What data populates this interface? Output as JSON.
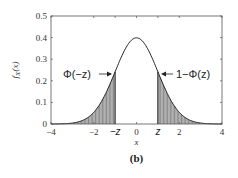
{
  "chart_data": {
    "type": "area",
    "title": "",
    "caption": "(b)",
    "xlabel": "x",
    "ylabel": "f_X(x)",
    "xlim": [
      -4,
      4
    ],
    "ylim": [
      0,
      0.5
    ],
    "xticks": [
      "-4",
      "-2",
      "-z",
      "0",
      "z",
      "2",
      "4"
    ],
    "xtick_values": [
      -4,
      -2,
      -1,
      0,
      1,
      2,
      4
    ],
    "yticks": [
      "0",
      "0.1",
      "0.2",
      "0.3",
      "0.4",
      "0.5"
    ],
    "grid": false,
    "series": [
      {
        "name": "standard normal pdf",
        "function": "exp(-x^2/2)/sqrt(2*pi)",
        "peak": 0.399
      }
    ],
    "z": 1.0,
    "shaded_regions": [
      {
        "name": "left tail",
        "from": -4,
        "to": -1,
        "label": "Φ(−z)"
      },
      {
        "name": "right tail",
        "from": 1,
        "to": 4,
        "label": "1−Φ(z)"
      }
    ],
    "annotations": [
      {
        "text": "Φ(−z)",
        "arrow_to": "left tail"
      },
      {
        "text": "1−Φ(z)",
        "arrow_to": "right tail"
      }
    ]
  },
  "labels": {
    "caption": "(b)",
    "xlabel": "x",
    "ylabel_main": "f",
    "ylabel_sub": "X",
    "ylabel_arg": "(x)",
    "left_anno": "Φ(−z)",
    "right_anno": "1−Φ(z)",
    "neg_z": "−z",
    "pos_z": "z"
  }
}
